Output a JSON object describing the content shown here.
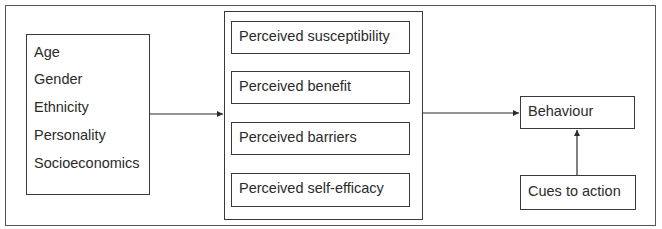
{
  "diagram": {
    "type": "flow",
    "left_box": {
      "items": [
        "Age",
        "Gender",
        "Ethnicity",
        "Personality",
        "Socioeconomics"
      ]
    },
    "center_box": {
      "items": [
        "Perceived susceptibility",
        "Perceived benefit",
        "Perceived barriers",
        "Perceived self-efficacy"
      ]
    },
    "behaviour": {
      "label": "Behaviour"
    },
    "cues": {
      "label": "Cues to action"
    },
    "edges": [
      {
        "from": "left_box",
        "to": "center_box"
      },
      {
        "from": "center_box",
        "to": "behaviour"
      },
      {
        "from": "cues",
        "to": "behaviour"
      }
    ]
  }
}
